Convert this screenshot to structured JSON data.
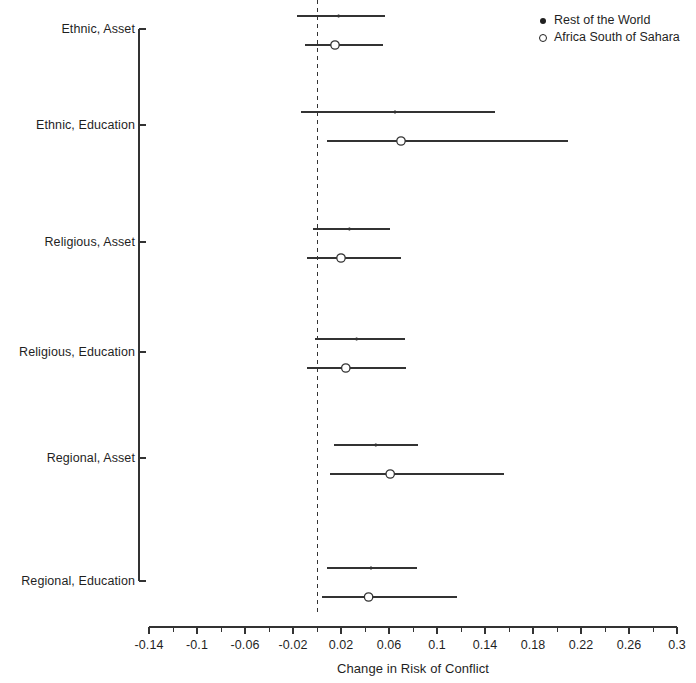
{
  "chart_data": {
    "type": "scatter",
    "title": "",
    "subtitle": "",
    "xlabel": "Change in Risk of Conflict",
    "ylabel": "",
    "xlim": [
      -0.14,
      0.3
    ],
    "ylim": [
      0,
      6
    ],
    "grid": false,
    "orientation": "horizontal",
    "reference_line": {
      "x": 0,
      "style": "dashed",
      "color": "#333333"
    },
    "legend": {
      "position": "top-right",
      "entries": [
        {
          "label": "Rest of the World",
          "marker": "filled-circle",
          "color": "#202020"
        },
        {
          "label": "Africa South of Sahara",
          "marker": "open-circle",
          "color": "#202020"
        }
      ]
    },
    "x_ticks_major": [
      -0.14,
      -0.1,
      -0.06,
      -0.02,
      0.02,
      0.06,
      0.1,
      0.14,
      0.18,
      0.22,
      0.26,
      0.3
    ],
    "x_tick_labels": [
      "-0.14",
      "-0.1",
      "-0.06",
      "-0.02",
      "0.02",
      "0.06",
      "0.1",
      "0.14",
      "0.18",
      "0.22",
      "0.26",
      "0.3"
    ],
    "x_ticks_minor": [
      -0.12,
      -0.08,
      -0.04,
      0,
      0.04,
      0.08,
      0.12,
      0.16,
      0.2,
      0.24,
      0.28
    ],
    "categories": [
      "Ethnic, Asset",
      "Ethnic, Education",
      "Religious, Asset",
      "Religious, Education",
      "Regional, Asset",
      "Regional, Education"
    ],
    "series": [
      {
        "name": "Rest of the World",
        "marker": "filled-circle",
        "estimates": [
          0.018,
          0.065,
          0.027,
          0.033,
          0.049,
          0.045
        ],
        "ci_low": [
          -0.017,
          -0.013,
          -0.003,
          -0.002,
          0.014,
          0.008
        ],
        "ci_high": [
          0.057,
          0.148,
          0.061,
          0.073,
          0.084,
          0.083
        ]
      },
      {
        "name": "Africa South of Sahara",
        "marker": "open-circle",
        "estimates": [
          0.015,
          0.07,
          0.02,
          0.024,
          0.061,
          0.043
        ],
        "ci_low": [
          -0.01,
          0.008,
          -0.008,
          -0.008,
          0.011,
          0.004
        ],
        "ci_high": [
          0.055,
          0.209,
          0.07,
          0.074,
          0.156,
          0.117
        ]
      }
    ]
  }
}
